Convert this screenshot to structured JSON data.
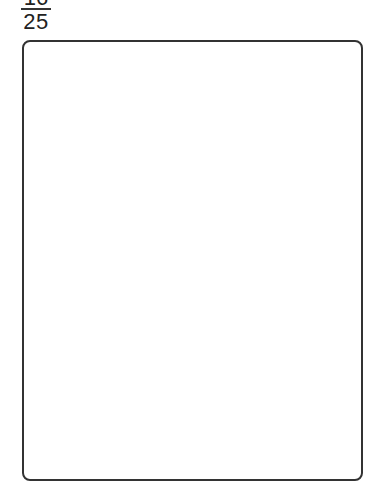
{
  "fraction": {
    "numerator": "16",
    "denominator": "25"
  },
  "answer_box": {
    "content": ""
  }
}
